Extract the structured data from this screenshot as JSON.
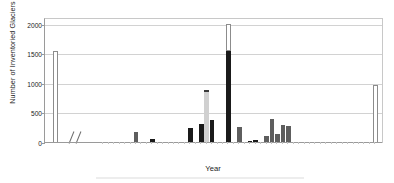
{
  "chart": {
    "type": "bar",
    "title": "",
    "xlabel": "Year",
    "ylabel": "Number of Inventoried Glaciers",
    "ylim": [
      0,
      2100
    ],
    "yticks": [
      "0",
      "500",
      "1000",
      "1500",
      "2000"
    ],
    "ytick_values": [
      0,
      500,
      1000,
      1500,
      2000
    ],
    "xticks": [
      "1850",
      "1950",
      "1955",
      "1960",
      "1965",
      "1970",
      "1975",
      "1980",
      "1985",
      "1990",
      "1995",
      "2000"
    ],
    "xtick_values": [
      1850,
      1950,
      1955,
      1960,
      1965,
      1970,
      1975,
      1980,
      1985,
      1990,
      1995,
      2000
    ],
    "grid": "horizontal",
    "legend": "none",
    "axis_break": "between 1850 and 1950"
  },
  "chart_data": {
    "type": "bar",
    "title": "",
    "xlabel": "Year",
    "ylabel": "Number of Inventoried Glaciers",
    "ylim": [
      0,
      2100
    ],
    "xlim": [
      1847,
      2002
    ],
    "yticks": [
      0,
      500,
      1000,
      1500,
      2000
    ],
    "ytick_labels": [
      "0",
      "500",
      "1000",
      "1500",
      "2000"
    ],
    "xtick_labels": [
      "1850",
      "1950",
      "1955",
      "1960",
      "1965",
      "1970",
      "1975",
      "1980",
      "1985",
      "1990",
      "1995",
      "2000"
    ],
    "grid": true,
    "legend_position": "none",
    "categories": [
      1850,
      1950,
      1951,
      1952,
      1953,
      1954,
      1955,
      1956,
      1957,
      1958,
      1959,
      1960,
      1961,
      1962,
      1963,
      1964,
      1965,
      1966,
      1967,
      1968,
      1969,
      1970,
      1971,
      1972,
      1973,
      1974,
      1975,
      1976,
      1977,
      1978,
      1979,
      1980,
      1981,
      1982,
      1983,
      1984,
      1985,
      1990,
      1995,
      2000
    ],
    "values": [
      1560,
      0,
      0,
      0,
      0,
      0,
      15,
      180,
      25,
      0,
      65,
      10,
      10,
      15,
      0,
      0,
      15,
      255,
      0,
      330,
      890,
      390,
      20,
      0,
      1550,
      0,
      265,
      0,
      35,
      50,
      10,
      120,
      400,
      150,
      300,
      290,
      0,
      0,
      0,
      990
    ],
    "bar_styles": [
      "hollow",
      "none",
      "none",
      "none",
      "none",
      "none",
      "mid",
      "mid",
      "mid",
      "none",
      "dark",
      "mid",
      "mid",
      "mid",
      "none",
      "none",
      "mid",
      "dark",
      "none",
      "dark",
      "light",
      "dark",
      "mid",
      "none",
      "dark",
      "none",
      "mid",
      "none",
      "dark",
      "dark",
      "mid",
      "mid",
      "mid",
      "mid",
      "mid",
      "mid",
      "none",
      "none",
      "none",
      "hollow"
    ],
    "special": [
      {
        "year": 1850,
        "value": 1560,
        "style": "white outlined bar"
      },
      {
        "year": 1969,
        "value": 890,
        "style": "light gray bar with dark cap"
      },
      {
        "year": 1973,
        "value": 1550,
        "style": "black bar with white outlined extension to 2020"
      },
      {
        "year": 1973,
        "extension_top": 2020
      },
      {
        "year": 2000,
        "value": 990,
        "style": "white outlined bar"
      }
    ]
  }
}
